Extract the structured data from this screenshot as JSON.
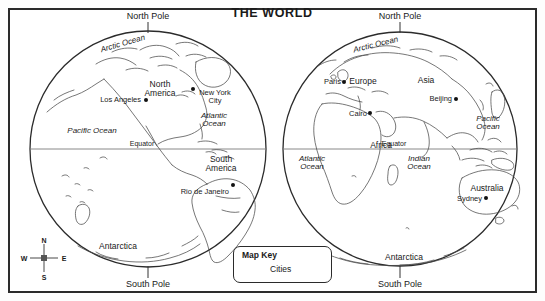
{
  "figure": {
    "title": "THE WORLD",
    "frame": {
      "shape": "rectangle-border"
    }
  },
  "globes": [
    {
      "name": "western-hemisphere",
      "center_x": 148,
      "center_y": 149,
      "radius": 118,
      "north_pole_label": "North Pole",
      "south_pole_label": "South Pole",
      "equator_label": "Equator",
      "oceans": [
        {
          "name": "Arctic Ocean",
          "x": 132,
          "y": 45,
          "rotate": -16
        },
        {
          "name": "Pacific Ocean",
          "x": 92,
          "y": 132,
          "rotate": 0
        },
        {
          "name": "Atlantic Ocean",
          "line1": "Atlantic",
          "line2": "Ocean",
          "x": 214,
          "y": 117
        }
      ],
      "continents": [
        {
          "name": "North America",
          "line1": "North",
          "line2": "America",
          "x": 160,
          "y": 85
        },
        {
          "name": "South America",
          "line1": "South",
          "line2": "America",
          "x": 221,
          "y": 160
        },
        {
          "name": "Antarctica",
          "x": 118,
          "y": 246
        }
      ],
      "cities": [
        {
          "name": "Los Angeles",
          "label_x": 141,
          "label_y": 100,
          "dot_x": 146,
          "dot_y": 100,
          "align": "right"
        },
        {
          "name": "New York City",
          "line1": "New York",
          "line2": "City",
          "label_x": 215,
          "label_y": 94,
          "dot_x": 193,
          "dot_y": 89,
          "align": "center"
        },
        {
          "name": "Rio de Janeiro",
          "label_x": 229,
          "label_y": 192,
          "dot_x": 233,
          "dot_y": 185,
          "align": "right"
        }
      ]
    },
    {
      "name": "eastern-hemisphere",
      "center_x": 400,
      "center_y": 149,
      "radius": 117,
      "north_pole_label": "North Pole",
      "south_pole_label": "South Pole",
      "equator_label": "Equator",
      "oceans": [
        {
          "name": "Arctic Ocean",
          "x": 385,
          "y": 46,
          "rotate": -14
        },
        {
          "name": "Pacific Ocean",
          "line1": "Pacific",
          "line2": "Ocean",
          "x": 488,
          "y": 120
        },
        {
          "name": "Atlantic Ocean",
          "line1": "Atlantic",
          "line2": "Ocean",
          "x": 312,
          "y": 160
        },
        {
          "name": "Indian Ocean",
          "line1": "Indian",
          "line2": "Ocean",
          "x": 419,
          "y": 160
        }
      ],
      "continents": [
        {
          "name": "Europe",
          "x": 363,
          "y": 82
        },
        {
          "name": "Asia",
          "x": 426,
          "y": 81
        },
        {
          "name": "Africa",
          "x": 381,
          "y": 145
        },
        {
          "name": "Australia",
          "x": 487,
          "y": 188
        },
        {
          "name": "Antarctica",
          "x": 404,
          "y": 257
        }
      ],
      "cities": [
        {
          "name": "Paris",
          "label_x": 341,
          "label_y": 82,
          "dot_x": 344,
          "dot_y": 82,
          "align": "right"
        },
        {
          "name": "Beijing",
          "label_x": 452,
          "label_y": 99,
          "dot_x": 456,
          "dot_y": 99,
          "align": "right"
        },
        {
          "name": "Cairo",
          "label_x": 367,
          "label_y": 114,
          "dot_x": 370,
          "dot_y": 113,
          "align": "right"
        },
        {
          "name": "Sydney",
          "label_x": 482,
          "label_y": 199,
          "dot_x": 486,
          "dot_y": 198,
          "align": "right"
        }
      ]
    }
  ],
  "compass": {
    "north": "N",
    "east": "E",
    "south": "S",
    "west": "W",
    "center_x": 44,
    "center_y": 258
  },
  "map_key": {
    "title": "Map Key",
    "items": [
      {
        "symbol": "dot",
        "label": "Cities"
      }
    ]
  },
  "colors": {
    "ink": "#1a1a1a",
    "frame": "#2b2b2b",
    "coastline": "#444444",
    "equator": "#6e6e6e",
    "background": "#ffffff"
  }
}
